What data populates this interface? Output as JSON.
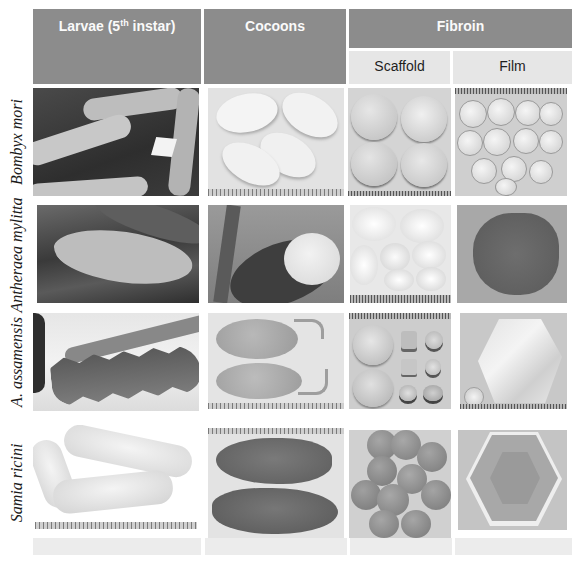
{
  "figure": {
    "header": {
      "columns": [
        {
          "label": "Larvae (5",
          "sup": "th",
          "label_after": " instar)"
        },
        {
          "label": "Cocoons"
        },
        {
          "label": "Fibroin",
          "subcolumns": [
            "Scaffold",
            "Film"
          ]
        }
      ]
    },
    "rows": [
      {
        "species": "Bombyx  mori",
        "cells": [
          "larvae-photo",
          "cocoons-photo",
          "scaffold-photo",
          "film-photo"
        ]
      },
      {
        "species": "Antheraea mylitta",
        "cells": [
          "larvae-photo",
          "cocoons-photo",
          "scaffold-photo",
          "film-photo"
        ]
      },
      {
        "species": "A. assamensis",
        "cells": [
          "larvae-photo",
          "cocoons-photo",
          "scaffold-photo",
          "film-photo"
        ]
      },
      {
        "species": "Samia ricini",
        "cells": [
          "larvae-photo",
          "cocoons-photo",
          "scaffold-photo",
          "film-photo"
        ]
      }
    ],
    "colors": {
      "header_bg": "#8c8c8c",
      "subheader_bg": "#e6e6e6",
      "header_text": "#fafafa"
    }
  }
}
